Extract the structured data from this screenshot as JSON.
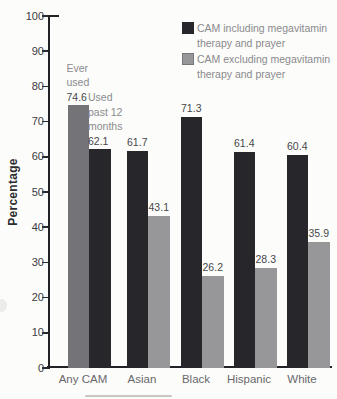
{
  "chart_data": {
    "type": "bar",
    "title": "",
    "ylabel": "Percentage",
    "ylim": [
      0,
      100
    ],
    "ytick_step": 10,
    "grid": false,
    "legend_position": "top-right",
    "colors": {
      "dark": "#26262b",
      "medium_gray": "#747478",
      "light_gray": "#97979a"
    },
    "legend": [
      {
        "label": "CAM including megavitamin therapy and prayer",
        "color_key": "dark"
      },
      {
        "label": "CAM excluding megavitamin therapy and prayer",
        "color_key": "light_gray"
      }
    ],
    "categories": [
      "Any CAM",
      "Asian",
      "Black",
      "Hispanic",
      "White"
    ],
    "groups": [
      {
        "label": "Any CAM",
        "bars": [
          {
            "value": 74.6,
            "color_key": "medium_gray",
            "annotation": "Ever used"
          },
          {
            "value": 62.1,
            "color_key": "dark",
            "annotation": "Used past 12 months"
          }
        ]
      },
      {
        "label": "Asian",
        "bars": [
          {
            "value": 61.7,
            "color_key": "dark"
          },
          {
            "value": 43.1,
            "color_key": "light_gray"
          }
        ]
      },
      {
        "label": "Black",
        "bars": [
          {
            "value": 71.3,
            "color_key": "dark"
          },
          {
            "value": 26.2,
            "color_key": "light_gray"
          }
        ]
      },
      {
        "label": "Hispanic",
        "bars": [
          {
            "value": 61.4,
            "color_key": "dark"
          },
          {
            "value": 28.3,
            "color_key": "light_gray"
          }
        ]
      },
      {
        "label": "White",
        "bars": [
          {
            "value": 60.4,
            "color_key": "dark"
          },
          {
            "value": 35.9,
            "color_key": "light_gray"
          }
        ]
      }
    ]
  }
}
